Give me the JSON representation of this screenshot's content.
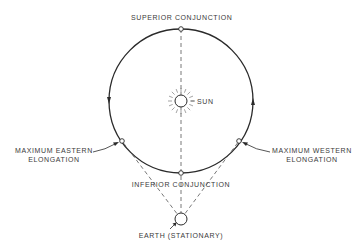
{
  "diagram": {
    "labels": {
      "superior_conjunction": "SUPERIOR CONJUNCTION",
      "sun": "SUN",
      "max_eastern_line1": "MAXIMUM EASTERN",
      "max_eastern_line2": "ELONGATION",
      "max_western_line1": "MAXIMUM WESTERN",
      "max_western_line2": "ELONGATION",
      "inferior_conjunction": "INFERIOR CONJUNCTION",
      "earth": "EARTH (STATIONARY)"
    },
    "geometry": {
      "orbit_center": [
        181,
        101
      ],
      "orbit_radius": 72,
      "sun_radius": 6,
      "earth_center": [
        181,
        219
      ],
      "earth_radius": 6,
      "nodes": {
        "superior_conjunction": [
          181,
          29
        ],
        "inferior_conjunction": [
          181,
          173
        ],
        "max_eastern_elongation": [
          122,
          141
        ],
        "max_western_elongation": [
          239,
          141
        ]
      },
      "orbit_direction": "counterclockwise"
    },
    "colors": {
      "line": "#2a2a2a",
      "dashed": "#555555",
      "text": "#3a3a3a",
      "background": "#ffffff"
    }
  }
}
